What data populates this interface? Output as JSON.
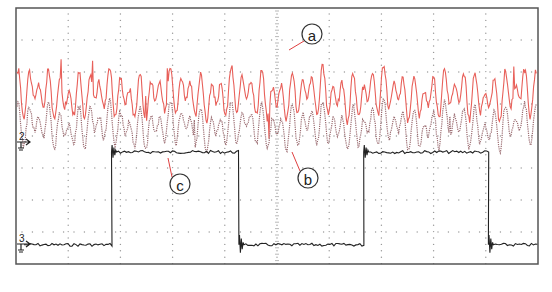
{
  "chart_data": {
    "type": "line",
    "title": "",
    "xlabel": "",
    "ylabel": "",
    "grid": true,
    "grid_divisions": {
      "x": 10,
      "y": 8
    },
    "legend": "none",
    "series": [
      {
        "name": "a",
        "channel": "1",
        "color": "#e8605a",
        "style": "solid",
        "description": "high-frequency oscillating signal, upper band",
        "center_div_from_top": 2.7,
        "amplitude_div": 1.0
      },
      {
        "name": "b",
        "channel": "2",
        "color": "#9a6b70",
        "style": "dotted",
        "description": "high-frequency oscillating signal, middle band, ground marker at div 4",
        "center_div_from_top": 3.7,
        "amplitude_div": 0.9
      },
      {
        "name": "c",
        "channel": "3",
        "color": "#222222",
        "style": "solid",
        "description": "square wave (low at div ~7.4, high at div ~4.5)",
        "transitions_x_div": [
          1.83,
          4.27,
          6.66,
          9.05
        ],
        "levels": [
          "low",
          "high",
          "low",
          "high",
          "low"
        ],
        "high_div_from_top": 4.5,
        "low_div_from_top": 7.4
      }
    ]
  },
  "annotations": [
    {
      "label": "a",
      "circle_x": 312,
      "circle_y": 34,
      "arrow_to_x": 289,
      "arrow_to_y": 50
    },
    {
      "label": "b",
      "circle_x": 308,
      "circle_y": 178,
      "arrow_to_x": 292,
      "arrow_to_y": 152
    },
    {
      "label": "c",
      "circle_x": 180,
      "circle_y": 184,
      "arrow_to_x": 168,
      "arrow_to_y": 158
    }
  ],
  "channel_markers": [
    {
      "label": "2",
      "y": 142
    },
    {
      "label": "3",
      "y": 244
    }
  ],
  "colors": {
    "frame": "#555555",
    "grid_dots": "#999999",
    "annotation_arrow": "#e04040"
  }
}
